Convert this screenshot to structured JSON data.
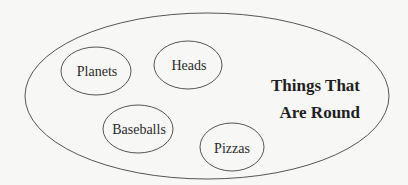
{
  "diagram": {
    "type": "set-diagram",
    "container": {
      "label_line1": "Things That",
      "label_line2": "Are Round"
    },
    "members": [
      {
        "label": "Planets"
      },
      {
        "label": "Heads"
      },
      {
        "label": "Baseballs"
      },
      {
        "label": "Pizzas"
      }
    ]
  }
}
